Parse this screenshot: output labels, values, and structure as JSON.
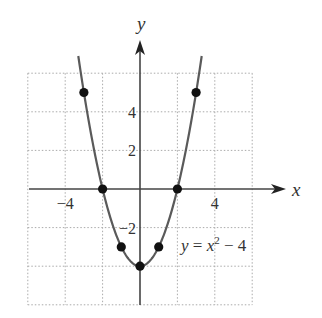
{
  "chart_data": {
    "type": "line",
    "title": "",
    "equation_label": {
      "y": "y",
      "eq": " = ",
      "x": "x",
      "sup": "2",
      "rest": " − 4"
    },
    "xlabel": "x",
    "ylabel": "y",
    "xlim": [
      -6,
      6
    ],
    "ylim": [
      -6,
      6
    ],
    "grid": true,
    "x_tick_labels": [
      {
        "value": -4,
        "text": "−4"
      },
      {
        "value": 4,
        "text": "4"
      }
    ],
    "y_tick_labels": [
      {
        "value": 4,
        "text": "4"
      },
      {
        "value": 2,
        "text": "2"
      },
      {
        "value": -2,
        "text": "−2"
      }
    ],
    "function": "y = x^2 - 4",
    "curve_domain": [
      -3.3,
      3.3
    ],
    "points": [
      {
        "x": -3,
        "y": 5
      },
      {
        "x": -2,
        "y": 0
      },
      {
        "x": -1,
        "y": -3
      },
      {
        "x": 0,
        "y": -4
      },
      {
        "x": 1,
        "y": -3
      },
      {
        "x": 2,
        "y": 0
      },
      {
        "x": 3,
        "y": 5
      }
    ],
    "colors": {
      "curve": "#5a5a5a",
      "points": "#111111",
      "axes": "#444444",
      "grid": "#aaaaaa"
    }
  }
}
